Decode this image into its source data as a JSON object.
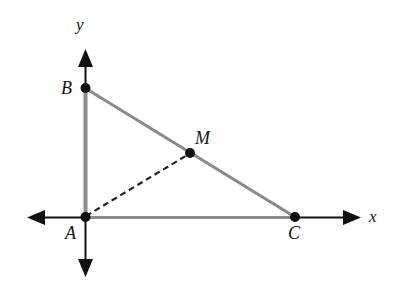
{
  "figure": {
    "kind": "coordinate-geometry-diagram",
    "background_color": "#ffffff",
    "axes": {
      "x_axis_label": "x",
      "y_axis_label": "y",
      "axis_color": "#111111",
      "axis_stroke_width": 2,
      "arrowheads": [
        "left",
        "right",
        "up",
        "down"
      ],
      "x_axis": {
        "x1": 28,
        "y1": 217,
        "x2": 360,
        "y2": 217
      },
      "y_axis": {
        "x1": 85,
        "y1": 50,
        "x2": 85,
        "y2": 276
      }
    },
    "triangle": {
      "side_color": "#8a8a8a",
      "side_stroke_width": 3,
      "sides": [
        {
          "name": "AB",
          "from": "A",
          "to": "B"
        },
        {
          "name": "BC",
          "from": "B",
          "to": "C"
        },
        {
          "name": "AC",
          "from": "A",
          "to": "C"
        }
      ]
    },
    "median": {
      "name": "AM",
      "from": "A",
      "to": "M",
      "style": "dashed",
      "color": "#262626",
      "stroke_width": 2,
      "dash_pattern": "6 4"
    },
    "points": [
      {
        "label": "A",
        "x": 85,
        "y": 217,
        "role": "origin / right-angle vertex",
        "dot_color": "#111111",
        "dot_radius": 5
      },
      {
        "label": "B",
        "x": 85,
        "y": 88,
        "role": "vertex on y-axis",
        "dot_color": "#111111",
        "dot_radius": 5
      },
      {
        "label": "C",
        "x": 295,
        "y": 217,
        "role": "vertex on x-axis",
        "dot_color": "#111111",
        "dot_radius": 5
      },
      {
        "label": "M",
        "x": 190,
        "y": 153,
        "role": "midpoint of hypotenuse BC",
        "dot_color": "#111111",
        "dot_radius": 5
      }
    ]
  }
}
